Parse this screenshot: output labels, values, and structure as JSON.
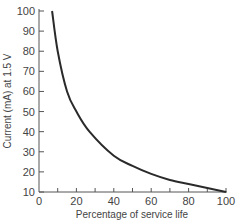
{
  "chart_data": {
    "type": "line",
    "title": "",
    "xlabel": "Percentage of service life",
    "ylabel": "Current (mA) at 1.5 V",
    "xlim": [
      0,
      100
    ],
    "ylim": [
      10,
      100
    ],
    "x_ticks": [
      0,
      20,
      40,
      60,
      80,
      100
    ],
    "y_ticks": [
      10,
      20,
      30,
      40,
      50,
      60,
      70,
      80,
      90,
      100
    ],
    "grid": false,
    "legend": null,
    "series": [
      {
        "name": "Current",
        "x": [
          7,
          10,
          15,
          20,
          27,
          40,
          50,
          60,
          70,
          80,
          90,
          100
        ],
        "y": [
          100,
          80,
          60,
          50,
          40,
          28,
          23,
          19,
          16,
          14,
          12,
          10
        ]
      }
    ]
  }
}
